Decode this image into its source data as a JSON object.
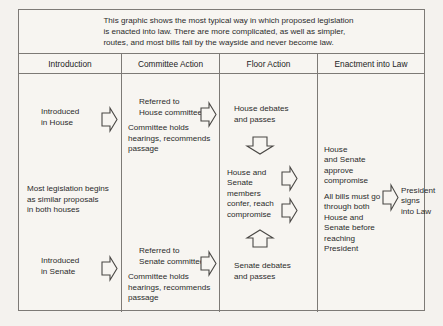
{
  "caption": {
    "text": "This graphic shows the most typical way in which proposed legislation\nis enacted into law. There are more complicated, as well as simpler,\nroutes, and most bills fall by the wayside and never become law."
  },
  "columns": [
    {
      "id": "introduction",
      "label": "Introduction"
    },
    {
      "id": "committee-action",
      "label": "Committee Action"
    },
    {
      "id": "floor-action",
      "label": "Floor Action"
    },
    {
      "id": "enactment-into-law",
      "label": "Enactment into Law"
    }
  ],
  "introduction": {
    "house": "Introduced\nin House",
    "note": "Most legislation begins\nas similar proposals\nin both houses",
    "senate": "Introduced\nin Senate"
  },
  "committee_action": {
    "house_referral": "Referred to\nHouse committee",
    "house_holds": "Committee holds\nhearings, recommends\npassage",
    "senate_referral": "Referred to\nSenate committee",
    "senate_holds": "Committee holds\nhearings, recommends\npassage"
  },
  "floor_action": {
    "house_debates": "House debates\nand passes",
    "conference": "House and\nSenate\nmembers\nconfer, reach\ncompromise",
    "senate_debates": "Senate debates\nand passes"
  },
  "enactment": {
    "approve": "House\nand Senate\napprove\ncompromise",
    "all_bills": "All bills must go\nthrough both\nHouse and\nSenate before\nreaching\nPresident",
    "president": "President\nsigns\ninto Law"
  },
  "arrows": [
    {
      "name": "arrow-house-to-committee",
      "direction": "right"
    },
    {
      "name": "arrow-committee-to-house-floor",
      "direction": "right"
    },
    {
      "name": "arrow-house-floor-to-conference",
      "direction": "down"
    },
    {
      "name": "arrow-conference-to-approve",
      "direction": "right"
    },
    {
      "name": "arrow-conference-to-all-bills",
      "direction": "right"
    },
    {
      "name": "arrow-senate-floor-to-conference",
      "direction": "up"
    },
    {
      "name": "arrow-senate-to-committee",
      "direction": "right"
    },
    {
      "name": "arrow-committee-to-senate-floor",
      "direction": "right"
    },
    {
      "name": "arrow-to-president",
      "direction": "right"
    }
  ],
  "colors": {
    "paper": "#f7f5f1",
    "rule": "#7d7a76",
    "ink": "#2b2b2b",
    "arrow_stroke": "#4a4845"
  }
}
